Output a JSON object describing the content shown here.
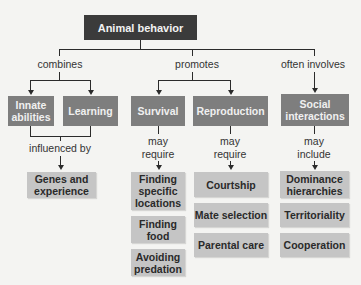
{
  "diagram": {
    "title": "Animal behavior",
    "relations": {
      "combines": "combines",
      "promotes": "promotes",
      "often_involves": "often involves",
      "influenced_by": "influenced by",
      "survival_link": "may\nrequire",
      "reproduction_link": "may\nrequire",
      "social_link": "may\ninclude"
    },
    "level2": {
      "innate": "Innate abilities",
      "learning": "Learning",
      "survival": "Survival",
      "reproduction": "Reproduction",
      "social": "Social interactions"
    },
    "genes": "Genes and experience",
    "survival_items": [
      "Finding specific locations",
      "Finding food",
      "Avoiding predation"
    ],
    "reproduction_items": [
      "Courtship",
      "Mate selection",
      "Parental care"
    ],
    "social_items": [
      "Dominance hierarchies",
      "Territoriality",
      "Cooperation"
    ]
  },
  "colors": {
    "root": "#3b3b3b",
    "category": "#7e7e7e",
    "leaf": "#c5c5c5",
    "background": "#f4f4f2"
  }
}
